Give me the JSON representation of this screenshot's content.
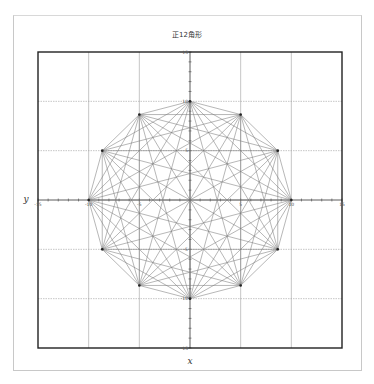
{
  "chart_data": {
    "type": "line",
    "title": "正12角形",
    "xlabel": "x",
    "ylabel": "y",
    "xlim": [
      -15,
      15
    ],
    "ylim": [
      -15,
      15
    ],
    "grid": true,
    "grid_step": 5,
    "x_tick_labels": [
      "-15",
      "-10",
      "-5",
      "0",
      "5",
      "10",
      "15"
    ],
    "y_tick_labels": [
      "-15",
      "-10",
      "-5",
      "0",
      "5",
      "10",
      "15"
    ],
    "polygon": {
      "sides": 12,
      "radius": 10,
      "center": [
        0,
        0
      ],
      "all_diagonals_drawn": true,
      "vertices": [
        [
          10,
          0
        ],
        [
          8.66,
          5
        ],
        [
          5,
          8.66
        ],
        [
          0,
          10
        ],
        [
          -5,
          8.66
        ],
        [
          -8.66,
          5
        ],
        [
          -10,
          0
        ],
        [
          -8.66,
          -5
        ],
        [
          -5,
          -8.66
        ],
        [
          0,
          -10
        ],
        [
          5,
          -8.66
        ],
        [
          8.66,
          -5
        ]
      ]
    },
    "colors": {
      "lines": "#7a7a7a",
      "grid": "#a0a0a0",
      "frame": "#222222"
    }
  }
}
